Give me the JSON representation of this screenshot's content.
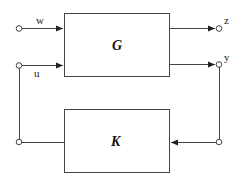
{
  "diagram": {
    "type": "block-diagram",
    "blocks": [
      {
        "id": "G",
        "label": "G"
      },
      {
        "id": "K",
        "label": "K"
      }
    ],
    "signals": {
      "w": "w",
      "u": "u",
      "z": "z",
      "y": "y"
    },
    "edges": [
      {
        "from": "w",
        "to": "G"
      },
      {
        "from": "u",
        "to": "G"
      },
      {
        "from": "G",
        "to": "z"
      },
      {
        "from": "G",
        "to": "y"
      },
      {
        "from": "y",
        "to": "K"
      },
      {
        "from": "K",
        "to": "u"
      }
    ],
    "line_color": "#444444"
  }
}
